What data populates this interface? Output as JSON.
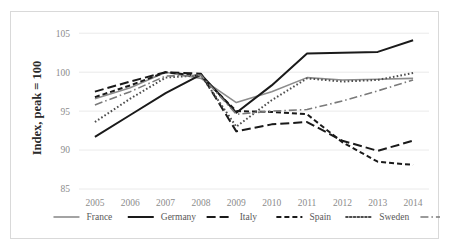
{
  "chart_data": {
    "type": "line",
    "title": "",
    "subtitle": "",
    "xlabel": "",
    "ylabel": "Index, peak = 100",
    "x": [
      2005,
      2006,
      2007,
      2008,
      2009,
      2010,
      2011,
      2012,
      2013,
      2014
    ],
    "categories": [
      "2005",
      "2006",
      "2007",
      "2008",
      "2009",
      "2010",
      "2011",
      "2012",
      "2013",
      "2014"
    ],
    "xtick_labels": [
      "2005",
      "2006",
      "2007",
      "2008",
      "2009",
      "2010",
      "2011",
      "2012",
      "2013",
      "2014"
    ],
    "ytick_labels": [
      "85",
      "90",
      "95",
      "100",
      "105"
    ],
    "yticks": [
      85,
      90,
      95,
      100,
      105
    ],
    "ylim": [
      85,
      105.8
    ],
    "xlim": [
      2004.55,
      2014.45
    ],
    "grid": "horizontal",
    "legend_position": "bottom",
    "series": [
      {
        "name": "France",
        "color": "#8c8c8c",
        "style": "solid",
        "dash": "0",
        "width": 1.6,
        "values": [
          96.6,
          98.0,
          100.0,
          99.2,
          96.1,
          97.5,
          99.3,
          99.0,
          99.1,
          99.2
        ]
      },
      {
        "name": "Germany",
        "color": "#1a1a1a",
        "style": "solid",
        "dash": "0",
        "width": 2.0,
        "values": [
          91.7,
          94.5,
          97.3,
          99.7,
          94.8,
          98.3,
          102.4,
          102.5,
          102.6,
          104.1
        ]
      },
      {
        "name": "Italy",
        "color": "#1a1a1a",
        "style": "long-dash",
        "dash": "9,4",
        "width": 2.0,
        "values": [
          97.5,
          98.8,
          100.0,
          99.8,
          92.4,
          93.3,
          93.6,
          91.2,
          89.9,
          91.2
        ]
      },
      {
        "name": "Spain",
        "color": "#1a1a1a",
        "style": "medium-dash",
        "dash": "5,3",
        "width": 2.0,
        "values": [
          96.8,
          98.3,
          100.0,
          99.5,
          95.0,
          94.9,
          94.6,
          91.0,
          88.5,
          88.1
        ]
      },
      {
        "name": "Sweden",
        "color": "#4d4d4d",
        "style": "dotted",
        "dash": "1.6,2.2",
        "width": 2.0,
        "values": [
          93.6,
          96.6,
          99.3,
          99.6,
          93.0,
          96.4,
          99.2,
          98.8,
          99.0,
          99.9
        ]
      },
      {
        "name": "UK",
        "color": "#7a7a7a",
        "style": "dash-dot",
        "dash": "8,3,1.5,3",
        "width": 1.6,
        "values": [
          95.8,
          97.5,
          99.5,
          99.6,
          94.6,
          95.0,
          95.2,
          96.3,
          97.6,
          99.0
        ]
      }
    ]
  },
  "legend": {
    "items": [
      {
        "label": "France"
      },
      {
        "label": "Germany"
      },
      {
        "label": "Italy"
      },
      {
        "label": "Spain"
      },
      {
        "label": "Sweden"
      },
      {
        "label": "UK"
      }
    ]
  },
  "colors": {
    "background": "#ffffff",
    "border": "#d9d9d9",
    "gridline": "#e4e4e4",
    "tick_text": "#8c8c8c",
    "axis_title_text": "#2b2b2b",
    "legend_text": "#595959"
  }
}
